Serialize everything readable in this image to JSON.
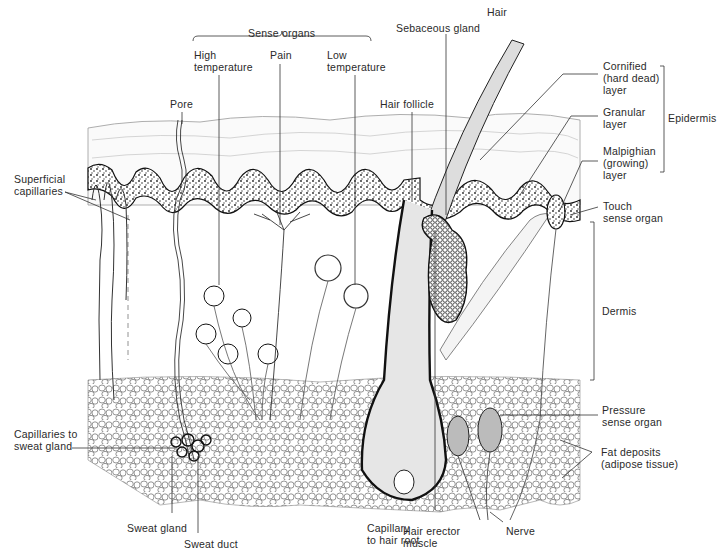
{
  "groups": {
    "sense_organs": "Sense organs",
    "epidermis": "Epidermis",
    "dermis": "Dermis"
  },
  "labels": {
    "high_temperature": "High\ntemperature",
    "pain": "Pain",
    "low_temperature": "Low\ntemperature",
    "sebaceous_gland": "Sebaceous gland",
    "hair": "Hair",
    "hair_follicle": "Hair follicle",
    "pore": "Pore",
    "cornified_layer": "Cornified\n(hard dead)\nlayer",
    "granular_layer": "Granular\nlayer",
    "malpighian_layer": "Malpighian\n(growing)\nlayer",
    "touch_sense_organ": "Touch\nsense organ",
    "superficial_capillaries": "Superficial\ncapillaries",
    "capillaries_to_sweat_gland": "Capillaries to\nsweat gland",
    "sweat_gland": "Sweat gland",
    "sweat_duct": "Sweat duct",
    "capillary_to_hair_root": "Capillary\nto hair root",
    "hair_erector_muscle": "Hair erector\nmuscle",
    "nerve": "Nerve",
    "pressure_sense_organ": "Pressure\nsense organ",
    "fat_deposits": "Fat deposits\n(adipose tissue)"
  }
}
